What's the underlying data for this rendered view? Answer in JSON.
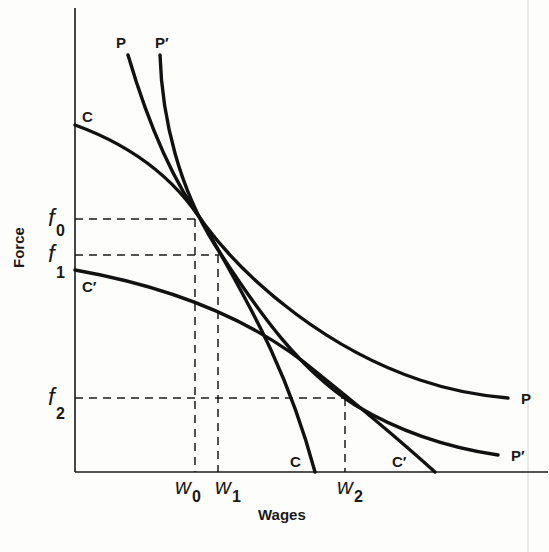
{
  "figure": {
    "x_axis_label": "Wages",
    "y_axis_label": "Force",
    "y_ticks": [
      {
        "base": "f",
        "sub": "0"
      },
      {
        "base": "f",
        "sub": "1"
      },
      {
        "base": "f",
        "sub": "2"
      }
    ],
    "x_ticks": [
      {
        "base": "w",
        "sub": "0"
      },
      {
        "base": "w",
        "sub": "1"
      },
      {
        "base": "w",
        "sub": "2"
      }
    ],
    "curve_labels": {
      "P_top": "P",
      "P_prime_top": "P′",
      "C_top": "C",
      "C_prime_left": "C′",
      "P_right": "P",
      "P_prime_right": "P′",
      "C_bottom": "C",
      "C_prime_bottom": "C′"
    },
    "colors": {
      "ink": "#1a1a1a",
      "background": "#fdfdfc"
    }
  }
}
